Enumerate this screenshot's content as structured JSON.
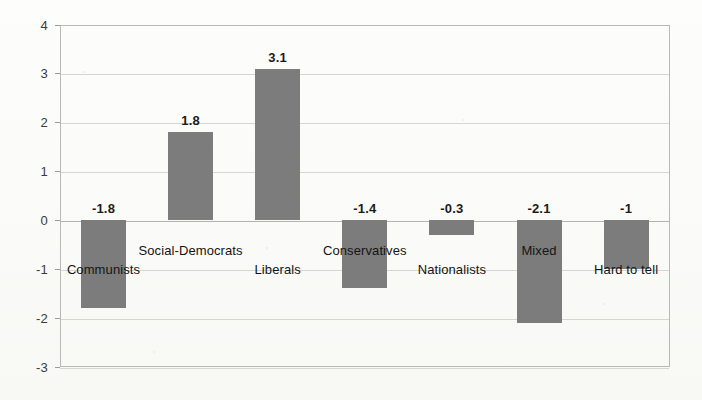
{
  "chart_data": {
    "type": "bar",
    "title": "",
    "xlabel": "",
    "ylabel": "",
    "categories": [
      "Communists",
      "Social-Democrats",
      "Liberals",
      "Conservatives",
      "Nationalists",
      "Mixed",
      "Hard to tell"
    ],
    "values": [
      -1.8,
      1.8,
      3.1,
      -1.4,
      -0.3,
      -2.1,
      -1
    ],
    "value_labels": [
      "-1.8",
      "1.8",
      "3.1",
      "-1.4",
      "-0.3",
      "-2.1",
      "-1"
    ],
    "ylim": [
      -3,
      4
    ],
    "yticks": [
      4,
      3,
      2,
      1,
      0,
      -1,
      -2,
      -3
    ],
    "ytick_labels": [
      "4",
      "3",
      "2",
      "1",
      "0",
      "-1",
      "-2",
      "-3"
    ],
    "grid": true,
    "legend": "none",
    "bar_color": "#7c7c7c",
    "background_color": "#fbfbf9",
    "gridline_color": "#d6d6d1",
    "axis_color": "#b9b9b4"
  },
  "layout": {
    "plot_left": 60,
    "plot_right": 670,
    "plot_top": 25,
    "plot_bottom": 367,
    "zero_y": 220,
    "px_per_unit": 48.857,
    "bar_width": 45,
    "slot_width": 87.1,
    "first_slot_center": 103.5,
    "value_label_offset": 16,
    "cat_label_row_a": 243,
    "cat_label_row_b": 262
  }
}
